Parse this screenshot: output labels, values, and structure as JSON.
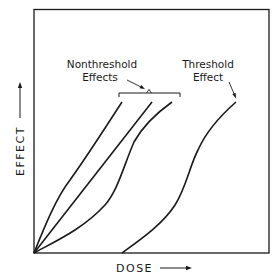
{
  "diagram": {
    "type": "dose-response curves",
    "x_axis": {
      "label": "DOSE",
      "arrow": "right"
    },
    "y_axis": {
      "label": "EFFECT",
      "arrow": "up"
    },
    "annotations": {
      "nonthreshold": {
        "line1": "Nonthreshold",
        "line2": "Effects"
      },
      "threshold": {
        "line1": "Threshold",
        "line2": "Effect"
      }
    },
    "curves": [
      {
        "name": "nonthreshold-1",
        "shape": "concave (supralinear)",
        "starts_at_origin": true
      },
      {
        "name": "nonthreshold-2",
        "shape": "linear",
        "starts_at_origin": true
      },
      {
        "name": "nonthreshold-3",
        "shape": "convex (sublinear)",
        "starts_at_origin": true
      },
      {
        "name": "threshold",
        "shape": "sigmoid",
        "starts_at_origin": false
      }
    ],
    "colors": {
      "line": "#1a1a1a",
      "background": "#ffffff"
    }
  }
}
